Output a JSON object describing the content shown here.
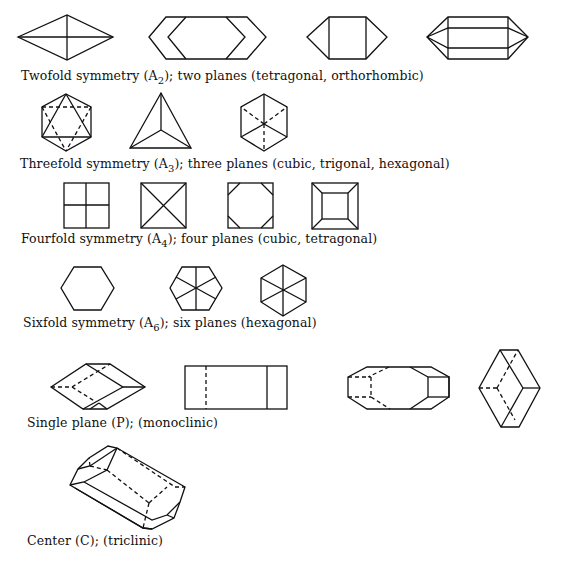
{
  "figure": {
    "groups": [
      {
        "id": "twofold",
        "caption_pre": "Twofold symmetry (A",
        "caption_sub": "2",
        "caption_post": "); two planes (tetragonal, orthorhombic)",
        "shapes": [
          "rhombic-dipyramid",
          "elongated-hexagonal-prism",
          "prism-with-pyramid-ends",
          "doubly-terminated-prism"
        ]
      },
      {
        "id": "threefold",
        "caption_pre": "Threefold symmetry (A",
        "caption_sub": "3",
        "caption_post": "); three planes (cubic, trigonal, hexagonal)",
        "shapes": [
          "octahedron-hexagonal-outline",
          "tetrahedron",
          "cube-corner-view"
        ]
      },
      {
        "id": "fourfold",
        "caption_pre": "Fourfold symmetry (A",
        "caption_sub": "4",
        "caption_post": "); four planes (cubic, tetragonal)",
        "shapes": [
          "square-quartered",
          "square-diagonals",
          "truncated-square",
          "square-frustum"
        ]
      },
      {
        "id": "sixfold",
        "caption_pre": "Sixfold symmetry (A",
        "caption_sub": "6",
        "caption_post": "); six planes (hexagonal)",
        "shapes": [
          "hexagon-plain",
          "hexagon-edge-midlines",
          "hexagon-diagonals"
        ]
      },
      {
        "id": "single-plane",
        "caption_pre": "Single plane (P); (monoclinic)",
        "caption_sub": "",
        "caption_post": "",
        "shapes": [
          "monoclinic-rhomb",
          "monoclinic-rectangle",
          "monoclinic-octagonal-prism",
          "monoclinic-rhomb-vertical"
        ]
      },
      {
        "id": "center",
        "caption_pre": "Center (C); (triclinic)",
        "caption_sub": "",
        "caption_post": "",
        "shapes": [
          "triclinic-prism"
        ]
      }
    ],
    "colors": {
      "line": "#111111",
      "background": "#ffffff"
    }
  }
}
